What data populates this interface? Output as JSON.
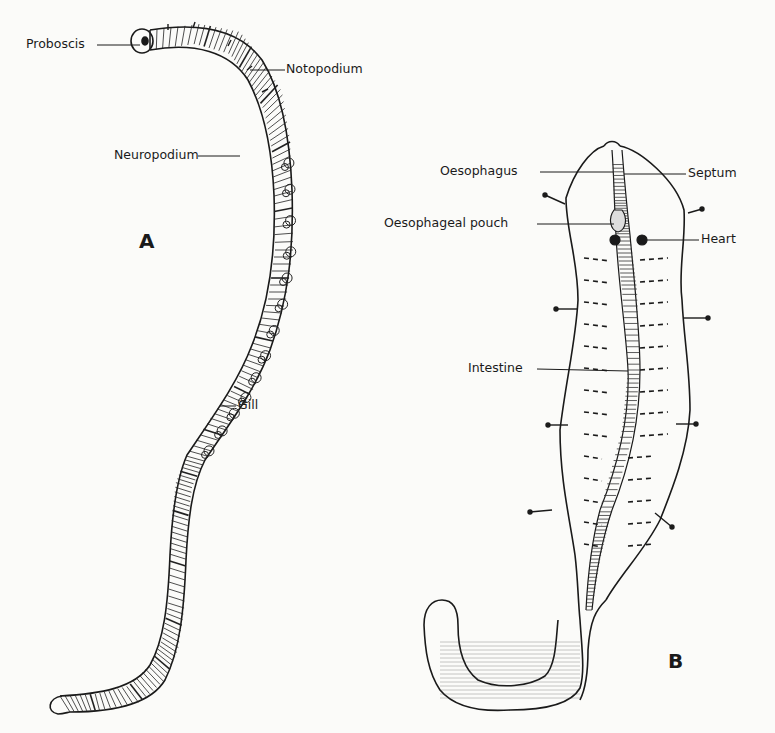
{
  "figure": {
    "panels": [
      {
        "id": "A",
        "letter": "A",
        "labels": {
          "proboscis": "Proboscis",
          "notopodium": "Notopodium",
          "neuropodium": "Neuropodium",
          "gill": "Gill"
        }
      },
      {
        "id": "B",
        "letter": "B",
        "labels": {
          "oesophagus": "Oesophagus",
          "septum": "Septum",
          "oesophageal_pouch": "Oesophageal pouch",
          "heart": "Heart",
          "intestine": "Intestine"
        }
      }
    ],
    "colors": {
      "ink": "#1a1a1a",
      "paper": "#fbfbf9"
    }
  }
}
